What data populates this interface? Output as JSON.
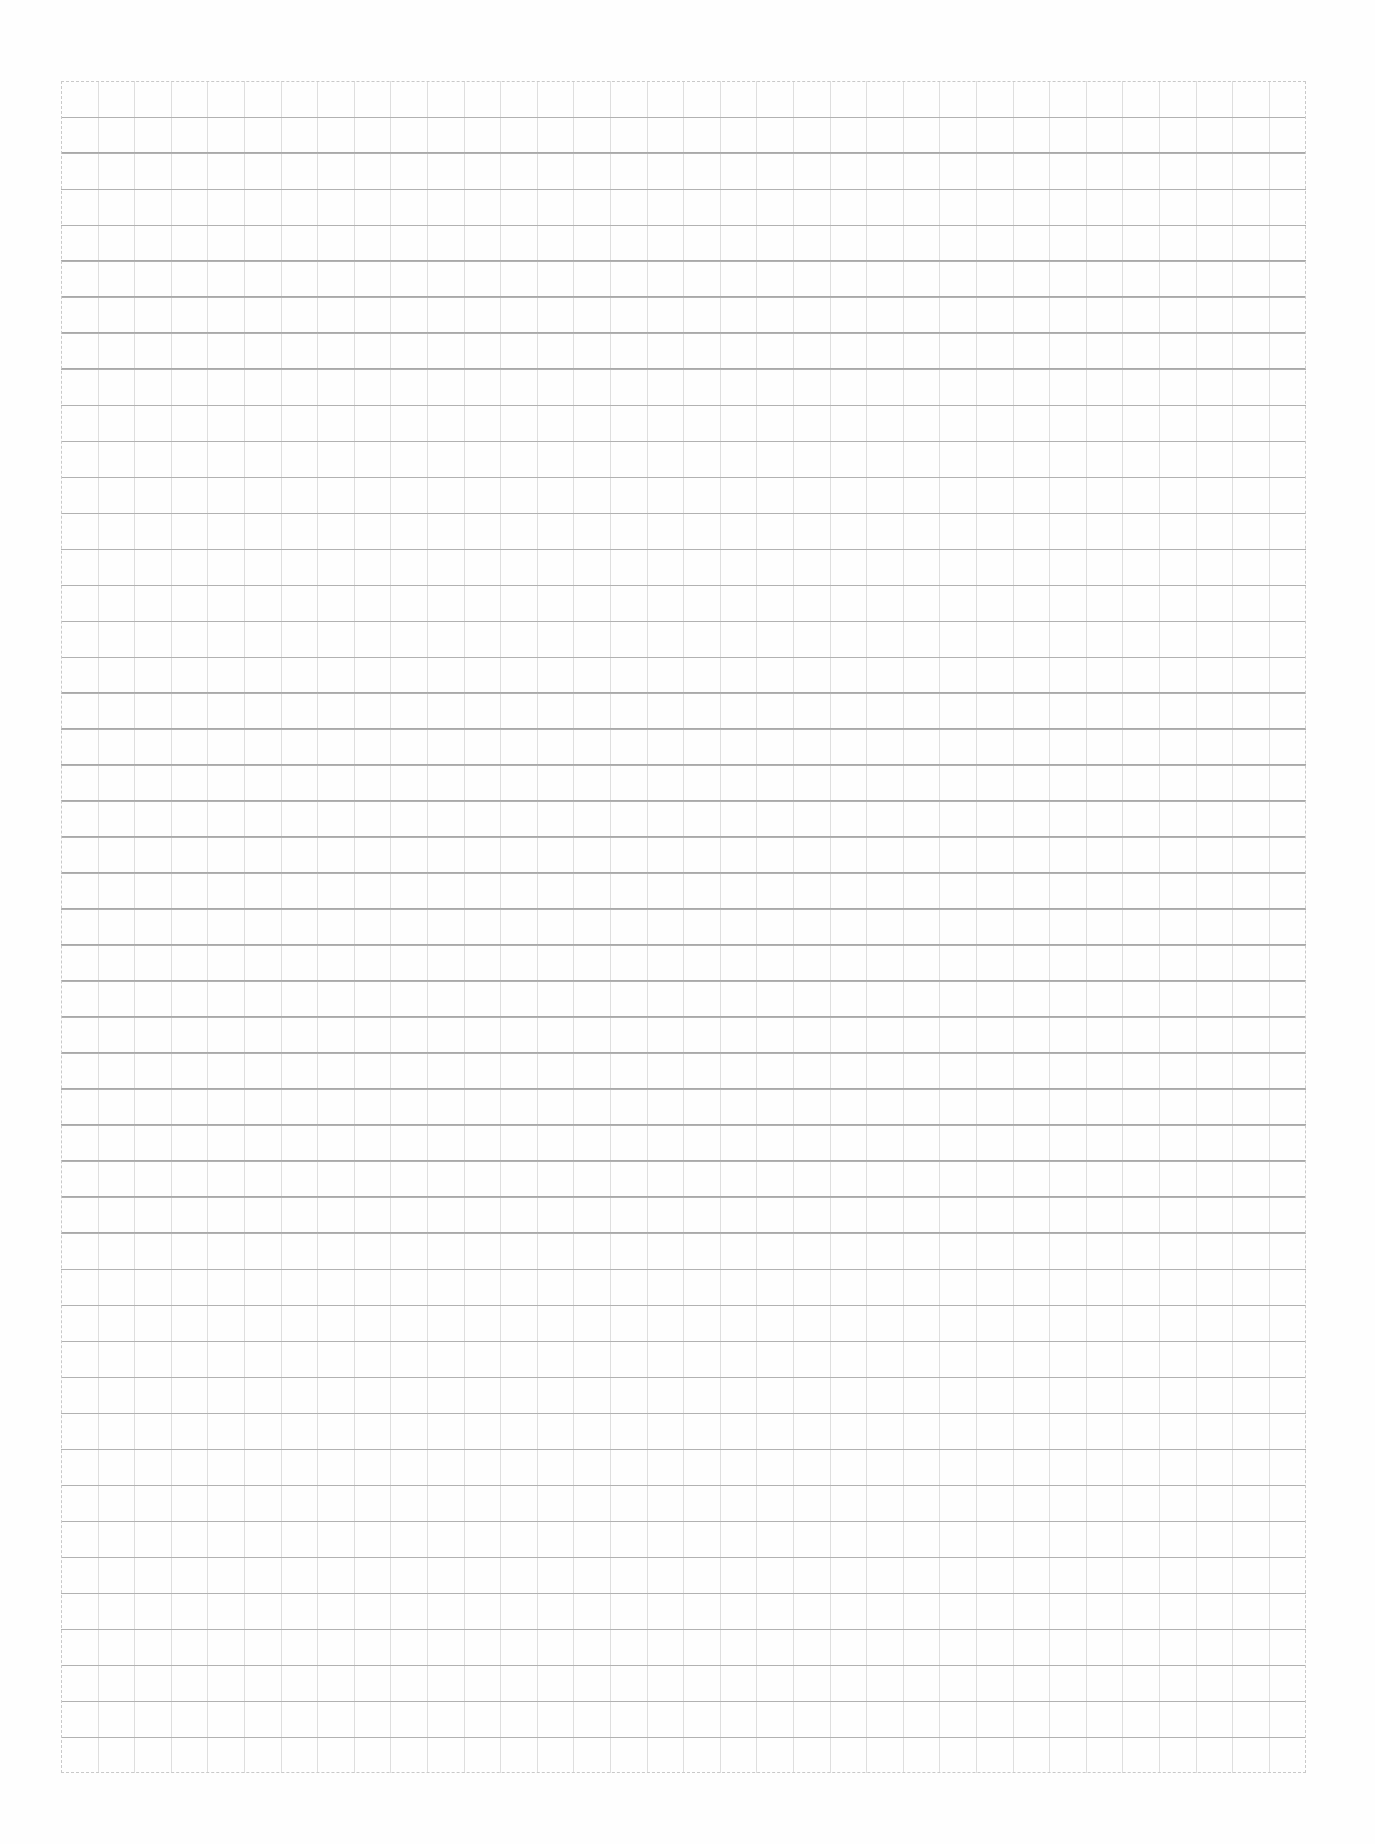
{
  "document": {
    "type": "grid-paper",
    "description": "Blank scanned sheet of square grid paper",
    "grid": {
      "columns": 34,
      "rows": 47,
      "horizontal_line_color": "#a9a9a9",
      "vertical_line_color": "#dedede",
      "background_color": "#fefefe"
    },
    "text_content": ""
  }
}
